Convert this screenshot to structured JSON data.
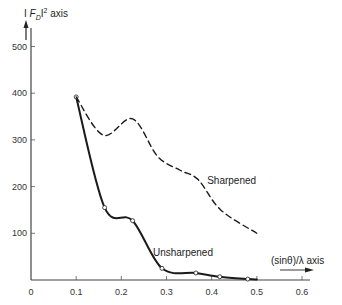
{
  "chart_data": {
    "type": "line",
    "title": "",
    "xlabel": "(sinθ)/λ axis",
    "ylabel": "| F_D|² axis",
    "ylabel_parts": {
      "pre": "I ",
      "F": "F",
      "sub": "D",
      "post": "I",
      "sup": "2",
      "suffix": " axis"
    },
    "xlim": [
      0,
      0.6
    ],
    "ylim": [
      0,
      500
    ],
    "x_ticks": [
      0,
      0.1,
      0.2,
      0.3,
      0.4,
      0.5,
      0.6
    ],
    "x_tick_labels": [
      "0",
      "0.1",
      "0.2",
      "0.3",
      "0.4",
      "0.5",
      "0.6"
    ],
    "y_ticks": [
      100,
      200,
      300,
      400,
      500
    ],
    "y_tick_labels": [
      "100",
      "200",
      "300",
      "400",
      "500"
    ],
    "origin_label": "0",
    "grid": false,
    "legend": "inline labels",
    "series": [
      {
        "name": "Unsharpened",
        "style": "solid",
        "markers": "open-circle",
        "x": [
          0.1,
          0.163,
          0.225,
          0.29,
          0.365,
          0.418,
          0.48,
          0.5
        ],
        "y": [
          392,
          155,
          127,
          25,
          15,
          7,
          2,
          1
        ]
      },
      {
        "name": "Sharpened",
        "style": "dashed",
        "markers": "none",
        "x": [
          0.1,
          0.16,
          0.225,
          0.28,
          0.33,
          0.37,
          0.42,
          0.5
        ],
        "y": [
          392,
          310,
          345,
          265,
          235,
          215,
          150,
          100
        ]
      }
    ],
    "annotations": [
      {
        "text": "Sharpened",
        "x": 0.39,
        "y": 205
      },
      {
        "text": "Unsharpened",
        "x": 0.27,
        "y": 52
      }
    ]
  }
}
